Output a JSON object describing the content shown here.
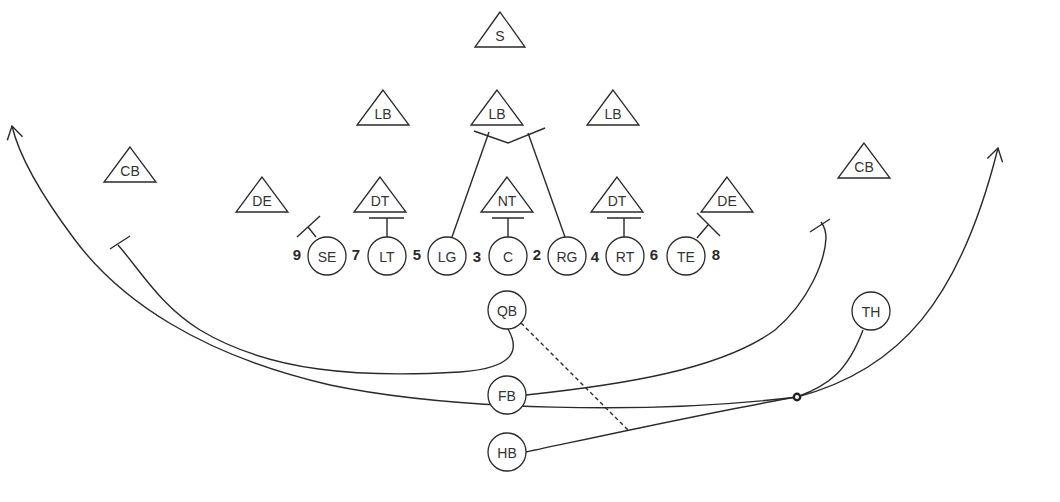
{
  "diagram": {
    "type": "football-play",
    "colors": {
      "line": "#2a2a2a",
      "text": "#333333",
      "background": "#ffffff"
    },
    "defense": [
      {
        "id": "s",
        "label": "S",
        "x": 500,
        "y": 12,
        "w": 50
      },
      {
        "id": "lb-l",
        "label": "LB",
        "x": 383,
        "y": 90,
        "w": 52
      },
      {
        "id": "lb-m",
        "label": "LB",
        "x": 497,
        "y": 90,
        "w": 52
      },
      {
        "id": "lb-r",
        "label": "LB",
        "x": 613,
        "y": 90,
        "w": 52
      },
      {
        "id": "cb-l",
        "label": "CB",
        "x": 130,
        "y": 147,
        "w": 52
      },
      {
        "id": "cb-r",
        "label": "CB",
        "x": 864,
        "y": 143,
        "w": 52
      },
      {
        "id": "de-l",
        "label": "DE",
        "x": 262,
        "y": 177,
        "w": 52
      },
      {
        "id": "dt-l",
        "label": "DT",
        "x": 380,
        "y": 177,
        "w": 52
      },
      {
        "id": "nt",
        "label": "NT",
        "x": 507,
        "y": 177,
        "w": 52
      },
      {
        "id": "dt-r",
        "label": "DT",
        "x": 617,
        "y": 177,
        "w": 52
      },
      {
        "id": "de-r",
        "label": "DE",
        "x": 727,
        "y": 177,
        "w": 52
      }
    ],
    "offense": [
      {
        "id": "se",
        "label": "SE",
        "x": 327,
        "y": 256
      },
      {
        "id": "lt",
        "label": "LT",
        "x": 387,
        "y": 256
      },
      {
        "id": "lg",
        "label": "LG",
        "x": 447,
        "y": 256
      },
      {
        "id": "c",
        "label": "C",
        "x": 508,
        "y": 256
      },
      {
        "id": "rg",
        "label": "RG",
        "x": 567,
        "y": 256
      },
      {
        "id": "rt",
        "label": "RT",
        "x": 625,
        "y": 256
      },
      {
        "id": "te",
        "label": "TE",
        "x": 686,
        "y": 256
      },
      {
        "id": "qb",
        "label": "QB",
        "x": 507,
        "y": 310
      },
      {
        "id": "fb",
        "label": "FB",
        "x": 507,
        "y": 395
      },
      {
        "id": "hb",
        "label": "HB",
        "x": 507,
        "y": 452
      },
      {
        "id": "th",
        "label": "TH",
        "x": 871,
        "y": 311
      }
    ],
    "gap_numbers": [
      {
        "label": "9",
        "x": 297,
        "y": 254
      },
      {
        "label": "7",
        "x": 356,
        "y": 254
      },
      {
        "label": "5",
        "x": 417,
        "y": 254
      },
      {
        "label": "3",
        "x": 477,
        "y": 256
      },
      {
        "label": "2",
        "x": 537,
        "y": 254
      },
      {
        "label": "4",
        "x": 595,
        "y": 256
      },
      {
        "label": "6",
        "x": 654,
        "y": 254
      },
      {
        "label": "8",
        "x": 716,
        "y": 254
      }
    ],
    "routes": [
      {
        "id": "route-qb-left-flat-block",
        "d": "M 508 329 C 520 350, 515 368, 460 372 C 360 378, 270 372, 200 330 C 160 305, 140 270, 118 245",
        "end": "block"
      },
      {
        "id": "route-fb-right-block",
        "d": "M 526 395 C 620 385, 720 370, 775 330 C 810 300, 825 260, 826 238 C 826 230, 824 226, 821 222",
        "end": "block"
      },
      {
        "id": "route-lg-to-lb",
        "d": "M 452 237 L 489 132",
        "end": "none"
      },
      {
        "id": "route-rg-to-lb",
        "d": "M 565 237 L 528 133",
        "end": "none"
      },
      {
        "id": "route-hb-sweep",
        "d": "M 526 452 C 620 432, 720 410, 797 397",
        "end": "none"
      },
      {
        "id": "route-th-to-mesh",
        "d": "M 863 330 C 848 370, 830 385, 797 397",
        "end": "none"
      },
      {
        "id": "route-deep-right",
        "d": "M 797 397 C 900 370, 960 300, 998 148",
        "end": "arrow"
      },
      {
        "id": "route-deep-left",
        "d": "M 797 397 C 650 415, 450 410, 330 385 C 200 355, 120 300, 75 240 C 45 200, 20 160, 12 126",
        "end": "arrow"
      },
      {
        "id": "route-qb-pitch",
        "d": "M 521 323 L 630 432",
        "end": "none",
        "dashed": true
      }
    ],
    "blocks": [
      {
        "id": "block-lb-mid",
        "d": "M 474 131 L 508 143 L 545 128"
      },
      {
        "id": "block-dt-l",
        "d": "M 369 218 L 404 218 M 387 218 L 387 237"
      },
      {
        "id": "block-nt",
        "d": "M 492 218 L 524 218 M 508 218 L 508 237"
      },
      {
        "id": "block-dt-r",
        "d": "M 607 218 L 641 218 M 624 218 L 624 237"
      },
      {
        "id": "block-se",
        "d": "M 297 237 L 320 216 M 308 227 L 316 237"
      },
      {
        "id": "block-te",
        "d": "M 697 213 L 720 236 M 708 225 L 697 238"
      },
      {
        "id": "block-cb-l",
        "d": "M 110 249 L 130 236"
      },
      {
        "id": "block-cb-r",
        "d": "M 810 232 L 830 219"
      }
    ],
    "mesh_point": {
      "x": 797,
      "y": 397
    }
  }
}
